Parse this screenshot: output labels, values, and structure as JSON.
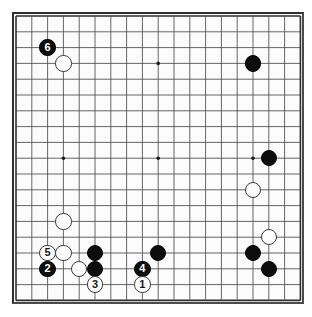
{
  "board": {
    "title": "Go Game Board Diagram",
    "size": 19,
    "origin_x": 16,
    "origin_y": 16,
    "spacing": 15.8,
    "stone_radius": 8.2,
    "line_color": "#555555",
    "edge_color": "#2e2e2e",
    "background_color": "#fcfcfc",
    "black_color": "#0d0d0d",
    "white_color": "#ffffff",
    "star_points": [
      {
        "col": 4,
        "row": 4
      },
      {
        "col": 10,
        "row": 4
      },
      {
        "col": 16,
        "row": 4
      },
      {
        "col": 4,
        "row": 10
      },
      {
        "col": 10,
        "row": 10
      },
      {
        "col": 16,
        "row": 10
      },
      {
        "col": 4,
        "row": 16
      },
      {
        "col": 10,
        "row": 16
      },
      {
        "col": 16,
        "row": 16
      }
    ],
    "stones": [
      {
        "id": "stone-black-c3-r3",
        "color": "black",
        "col": 3,
        "row": 3,
        "label": "6"
      },
      {
        "id": "stone-white-c4-r4",
        "color": "white",
        "col": 4,
        "row": 4,
        "label": ""
      },
      {
        "id": "stone-black-c16-r4",
        "color": "black",
        "col": 16,
        "row": 4,
        "label": ""
      },
      {
        "id": "stone-black-c17-r10",
        "color": "black",
        "col": 17,
        "row": 10,
        "label": ""
      },
      {
        "id": "stone-white-c16-r12",
        "color": "white",
        "col": 16,
        "row": 12,
        "label": ""
      },
      {
        "id": "stone-white-c4-r14",
        "color": "white",
        "col": 4,
        "row": 14,
        "label": ""
      },
      {
        "id": "stone-white-c17-r15",
        "color": "white",
        "col": 17,
        "row": 15,
        "label": ""
      },
      {
        "id": "stone-white-c3-r16",
        "color": "white",
        "col": 3,
        "row": 16,
        "label": "5"
      },
      {
        "id": "stone-white-c4-r16",
        "color": "white",
        "col": 4,
        "row": 16,
        "label": ""
      },
      {
        "id": "stone-black-c6-r16",
        "color": "black",
        "col": 6,
        "row": 16,
        "label": ""
      },
      {
        "id": "stone-black-c10-r16",
        "color": "black",
        "col": 10,
        "row": 16,
        "label": ""
      },
      {
        "id": "stone-black-c16-r16",
        "color": "black",
        "col": 16,
        "row": 16,
        "label": ""
      },
      {
        "id": "stone-black-c3-r17",
        "color": "black",
        "col": 3,
        "row": 17,
        "label": "2"
      },
      {
        "id": "stone-white-c5-r17",
        "color": "white",
        "col": 5,
        "row": 17,
        "label": ""
      },
      {
        "id": "stone-black-c6-r17",
        "color": "black",
        "col": 6,
        "row": 17,
        "label": ""
      },
      {
        "id": "stone-black-c9-r17",
        "color": "black",
        "col": 9,
        "row": 17,
        "label": "4"
      },
      {
        "id": "stone-black-c17-r17",
        "color": "black",
        "col": 17,
        "row": 17,
        "label": ""
      },
      {
        "id": "stone-white-c6-r18",
        "color": "white",
        "col": 6,
        "row": 18,
        "label": "3"
      },
      {
        "id": "stone-white-c9-r18",
        "color": "white",
        "col": 9,
        "row": 18,
        "label": "1"
      }
    ],
    "move_labels": [
      "1",
      "2",
      "3",
      "4",
      "5",
      "6"
    ]
  }
}
